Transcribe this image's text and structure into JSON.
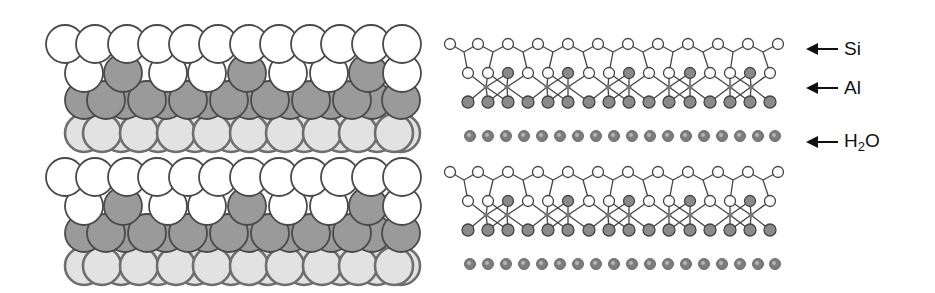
{
  "figure": {
    "title": "",
    "left_model": {
      "description": "Space-filling model of layered clay (kaolinite-like) — two repeating layers",
      "colors": {
        "white": "#ffffff",
        "gray": "#9a9a9a",
        "light": "#e2e2e2",
        "stroke": "#4a4a4a",
        "light_stroke": "#6e6e6e"
      },
      "layer_offset_y": 133,
      "layers": 2,
      "rows": [
        {
          "name": "top-oxygen-row",
          "y": 44,
          "r": 19,
          "fill": "white",
          "x": [
            65,
            95,
            127,
            157,
            188,
            218,
            249,
            279,
            310,
            340,
            371,
            402
          ]
        },
        {
          "name": "silicon-oxygen-row",
          "y": 73,
          "r": 19,
          "fill": "mixed",
          "x": [
            84,
            123,
            168,
            207,
            247,
            288,
            329,
            368,
            402
          ],
          "fills": [
            "white",
            "gray",
            "white",
            "white",
            "gray",
            "white",
            "white",
            "gray",
            "white"
          ]
        },
        {
          "name": "aluminum-back-row",
          "y": 100,
          "r": 19,
          "fill": "gray",
          "x": [
            84,
            125,
            166,
            207,
            249,
            290,
            331,
            372,
            401
          ]
        },
        {
          "name": "aluminum-front-row",
          "y": 100,
          "r": 19,
          "fill": "gray",
          "x": [
            106,
            147,
            188,
            229,
            270,
            311,
            352
          ]
        },
        {
          "name": "hydroxyl-back-row",
          "y": 133,
          "r": 19,
          "fill": "light",
          "x": [
            84,
            121,
            158,
            195,
            231,
            268,
            304,
            341,
            377,
            401
          ]
        },
        {
          "name": "hydroxyl-front-row",
          "y": 133,
          "r": 19,
          "fill": "light",
          "x": [
            102,
            139,
            176,
            212,
            249,
            285,
            322,
            358,
            394
          ]
        }
      ]
    },
    "right_model": {
      "description": "Ball-and-stick schematic of tetrahedral Si sheet, octahedral Al sheet and interlayer water",
      "layer_offset_y": 128,
      "si_row": {
        "y": 44,
        "r": 5.5,
        "x": [
          450,
          478,
          508,
          538,
          568,
          598,
          628,
          658,
          688,
          718,
          748,
          778
        ]
      },
      "mid_row": {
        "y": 73,
        "r": 5.5,
        "x": [
          468,
          488,
          508,
          528,
          548,
          568,
          589,
          609,
          629,
          649,
          669,
          690,
          710,
          730,
          750,
          770
        ],
        "fills": [
          "white",
          "white",
          "gray",
          "white",
          "white",
          "gray",
          "white",
          "white",
          "gray",
          "white",
          "white",
          "gray",
          "white",
          "white",
          "gray",
          "white"
        ]
      },
      "al_centers": {
        "y": 87,
        "x": [
          486,
          507,
          547,
          568,
          608,
          629,
          669,
          690,
          730,
          751
        ]
      },
      "bottom_row": {
        "y": 102,
        "r": 6,
        "x": [
          468,
          488,
          508,
          528,
          548,
          568,
          589,
          609,
          629,
          649,
          669,
          690,
          710,
          730,
          750,
          770
        ]
      },
      "water_row": {
        "y": 136,
        "r": 5.5,
        "x": [
          470,
          488,
          506,
          524,
          542,
          560,
          578,
          596,
          614,
          632,
          650,
          668,
          686,
          704,
          722,
          740,
          758,
          775
        ]
      },
      "colors": {
        "atom_white": "#ffffff",
        "atom_gray": "#8a8a8a",
        "water": "#7d7d7d",
        "bond": "#444444"
      }
    },
    "labels": [
      {
        "id": "si",
        "text": "Si",
        "x": 808,
        "y": 38
      },
      {
        "id": "al",
        "text": "Al",
        "x": 808,
        "y": 77
      },
      {
        "id": "h2o",
        "text_main": "H",
        "text_sub": "2",
        "text_tail": "O",
        "x": 808,
        "y": 130
      }
    ]
  }
}
